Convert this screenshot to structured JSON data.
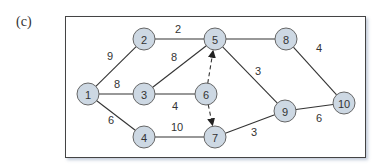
{
  "figure": {
    "label": "(c)"
  },
  "graph": {
    "nodes": [
      {
        "id": "1",
        "x": 88,
        "y": 94
      },
      {
        "id": "2",
        "x": 144,
        "y": 39
      },
      {
        "id": "3",
        "x": 144,
        "y": 94
      },
      {
        "id": "4",
        "x": 144,
        "y": 137
      },
      {
        "id": "5",
        "x": 215,
        "y": 39
      },
      {
        "id": "6",
        "x": 206,
        "y": 94
      },
      {
        "id": "7",
        "x": 215,
        "y": 137
      },
      {
        "id": "8",
        "x": 286,
        "y": 39
      },
      {
        "id": "9",
        "x": 285,
        "y": 111
      },
      {
        "id": "10",
        "x": 344,
        "y": 103
      }
    ],
    "edges": [
      {
        "from": "1",
        "to": "2",
        "weight": "9",
        "lx": 110,
        "ly": 56,
        "dashed": false
      },
      {
        "from": "1",
        "to": "3",
        "weight": "8",
        "lx": 117,
        "ly": 84,
        "dashed": false
      },
      {
        "from": "1",
        "to": "4",
        "weight": "6",
        "lx": 111,
        "ly": 120,
        "dashed": false
      },
      {
        "from": "2",
        "to": "5",
        "weight": "2",
        "lx": 178,
        "ly": 29,
        "dashed": false
      },
      {
        "from": "3",
        "to": "5",
        "weight": "8",
        "lx": 174,
        "ly": 57,
        "dashed": false
      },
      {
        "from": "3",
        "to": "6",
        "weight": "4",
        "lx": 175,
        "ly": 106,
        "dashed": false
      },
      {
        "from": "4",
        "to": "7",
        "weight": "10",
        "lx": 177,
        "ly": 127,
        "dashed": false
      },
      {
        "from": "5",
        "to": "8",
        "weight": "",
        "lx": 0,
        "ly": 0,
        "dashed": false
      },
      {
        "from": "5",
        "to": "9",
        "weight": "3",
        "lx": 258,
        "ly": 71,
        "dashed": false
      },
      {
        "from": "8",
        "to": "10",
        "weight": "4",
        "lx": 319,
        "ly": 48,
        "dashed": false
      },
      {
        "from": "7",
        "to": "9",
        "weight": "3",
        "lx": 254,
        "ly": 132,
        "dashed": false
      },
      {
        "from": "9",
        "to": "10",
        "weight": "6",
        "lx": 319,
        "ly": 118,
        "dashed": false
      },
      {
        "from": "6",
        "to": "5",
        "weight": "",
        "lx": 0,
        "ly": 0,
        "dashed": true
      },
      {
        "from": "6",
        "to": "7",
        "weight": "",
        "lx": 0,
        "ly": 0,
        "dashed": true
      }
    ],
    "colors": {
      "node_fill": "#cdd8e3",
      "node_stroke": "#666666",
      "edge": "#333333",
      "frame": "#444444"
    }
  }
}
